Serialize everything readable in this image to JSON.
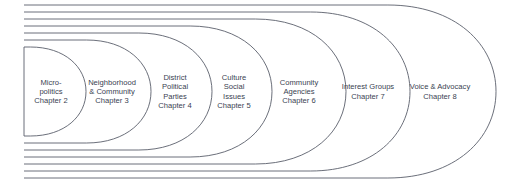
{
  "diagram": {
    "type": "nested-stadium-diagram",
    "stroke_color": "#5a5f6b",
    "text_color": "#3a3f52",
    "background_color": "#ffffff",
    "left_edge_x": 24,
    "levels": [
      {
        "index": 0,
        "lines": [
          "Micro-",
          "politics",
          "Chapter 2"
        ],
        "chapter": "Chapter 2",
        "topic": "Micro-politics",
        "center_x": 51,
        "center_y": 92,
        "right_x": 86,
        "top_y": 47,
        "bottom_y": 136
      },
      {
        "index": 1,
        "lines": [
          "Neighborhood",
          "& Community",
          "Chapter 3"
        ],
        "chapter": "Chapter 3",
        "topic": "Neighborhood & Community",
        "center_x": 112,
        "center_y": 92,
        "right_x": 151,
        "top_y": 40,
        "bottom_y": 143
      },
      {
        "index": 2,
        "lines": [
          "District",
          "Political",
          "Parties",
          "Chapter 4"
        ],
        "chapter": "Chapter 4",
        "topic": "District Political Parties",
        "center_x": 175,
        "center_y": 92,
        "right_x": 212,
        "top_y": 33,
        "bottom_y": 150
      },
      {
        "index": 3,
        "lines": [
          "Culture",
          "Social",
          "Issues",
          "Chapter 5"
        ],
        "chapter": "Chapter 5",
        "topic": "Culture Social Issues",
        "center_x": 234,
        "center_y": 92,
        "right_x": 272,
        "top_y": 26,
        "bottom_y": 157
      },
      {
        "index": 4,
        "lines": [
          "Community",
          "Agencies",
          "Chapter 6"
        ],
        "chapter": "Chapter 6",
        "topic": "Community Agencies",
        "center_x": 299,
        "center_y": 92,
        "right_x": 346,
        "top_y": 19,
        "bottom_y": 164
      },
      {
        "index": 5,
        "lines": [
          "Interest Groups",
          "Chapter 7"
        ],
        "chapter": "Chapter 7",
        "topic": "Interest Groups",
        "center_x": 368,
        "center_y": 92,
        "right_x": 410,
        "top_y": 12,
        "bottom_y": 171
      },
      {
        "index": 6,
        "lines": [
          "Voice & Advocacy",
          "Chapter 8"
        ],
        "chapter": "Chapter 8",
        "topic": "Voice & Advocacy",
        "center_x": 440,
        "center_y": 92,
        "right_x": 496,
        "top_y": 5,
        "bottom_y": 178
      }
    ]
  }
}
